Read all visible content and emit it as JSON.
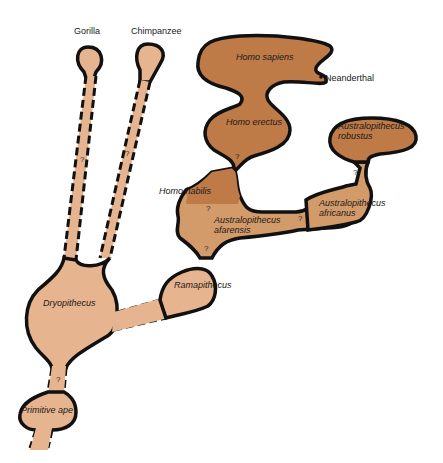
{
  "colors": {
    "ape_fill": "#E6B48E",
    "hominid_fill": "#BE7A47",
    "transition_fill": "#D39A6A",
    "outline": "#111111",
    "background": "#FFFFFF"
  },
  "labels": {
    "gorilla": "Gorilla",
    "chimpanzee": "Chimpanzee",
    "homo_sapiens": "Homo sapiens",
    "neanderthal": "Neanderthal",
    "homo_erectus": "Homo erectus",
    "australopithecus_robustus_1": "Australopithecus",
    "australopithecus_robustus_2": "robustus",
    "homo_habilis": "Homo habilis",
    "australopithecus_afarensis_1": "Australopithecus",
    "australopithecus_afarensis_2": "afarensis",
    "australopithecus_africanus_1": "Australopithecus",
    "australopithecus_africanus_2": "africanus",
    "ramapithecus": "Ramapithecus",
    "dryopithecus": "Dryopithecus",
    "primitive_ape": "Primitive ape"
  },
  "uncertainty_marks": {
    "mark": "?"
  }
}
